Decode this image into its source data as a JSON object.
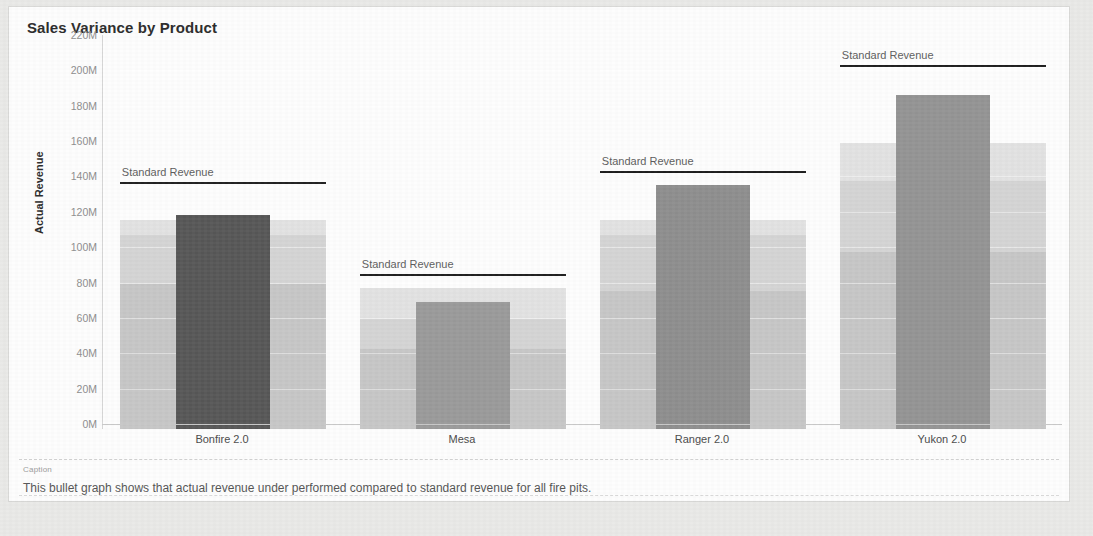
{
  "card": {
    "title": "Sales Variance by Product",
    "caption_label": "Caption",
    "caption_text": "This bullet graph shows that actual revenue under performed compared to standard revenue for all fire pits."
  },
  "colors": {
    "card_background": "#fdfdfd",
    "page_background": "#e9e9e7",
    "bar_dark": "#575757",
    "bar_mid": "#8e8e8e",
    "bar_light": "#9a9a9a",
    "band_low": "#c6c6c6",
    "band_mid": "#d4d4d4",
    "band_high": "#e2e2e2",
    "reference_line": "#1d1d1d",
    "axis_text": "#8d8d8d",
    "title_text": "#2b2b2b"
  },
  "chart_data": {
    "type": "bar",
    "chart_subtype": "bullet-graph",
    "title": "Sales Variance by Product",
    "xlabel": "",
    "ylabel": "Actual Revenue",
    "ylim": [
      0,
      220
    ],
    "y_unit": "M",
    "y_tick_labels": [
      "220M",
      "200M",
      "180M",
      "160M",
      "140M",
      "120M",
      "100M",
      "80M",
      "60M",
      "40M",
      "20M",
      "0M"
    ],
    "y_tick_values": [
      220,
      200,
      180,
      160,
      140,
      120,
      100,
      80,
      60,
      40,
      20,
      0
    ],
    "grid": true,
    "legend": "none",
    "categories": [
      "Bonfire 2.0",
      "Mesa",
      "Ranger 2.0",
      "Yukon 2.0"
    ],
    "series": [
      {
        "name": "Actual Revenue",
        "values": [
          121,
          72,
          138,
          189
        ],
        "bar_colors": [
          "#575757",
          "#9a9a9a",
          "#8e8e8e",
          "#949494"
        ]
      }
    ],
    "reference_lines": [
      {
        "name": "Standard Revenue",
        "label": "Standard Revenue",
        "category": "Bonfire 2.0",
        "value": 137
      },
      {
        "name": "Standard Revenue",
        "label": "Standard Revenue",
        "category": "Mesa",
        "value": 85
      },
      {
        "name": "Standard Revenue",
        "label": "Standard Revenue",
        "category": "Ranger 2.0",
        "value": 143
      },
      {
        "name": "Standard Revenue",
        "label": "Standard Revenue",
        "category": "Yukon 2.0",
        "value": 203
      }
    ],
    "qualitative_bands": [
      {
        "category": "Bonfire 2.0",
        "ranges": [
          {
            "from": 0,
            "to": 82
          },
          {
            "from": 82,
            "to": 110
          },
          {
            "from": 110,
            "to": 118
          }
        ]
      },
      {
        "category": "Mesa",
        "ranges": [
          {
            "from": 0,
            "to": 45
          },
          {
            "from": 45,
            "to": 62
          },
          {
            "from": 62,
            "to": 80
          }
        ]
      },
      {
        "category": "Ranger 2.0",
        "ranges": [
          {
            "from": 0,
            "to": 78
          },
          {
            "from": 78,
            "to": 110
          },
          {
            "from": 110,
            "to": 118
          }
        ]
      },
      {
        "category": "Yukon 2.0",
        "ranges": [
          {
            "from": 0,
            "to": 100
          },
          {
            "from": 100,
            "to": 140
          },
          {
            "from": 140,
            "to": 162
          }
        ]
      }
    ]
  }
}
